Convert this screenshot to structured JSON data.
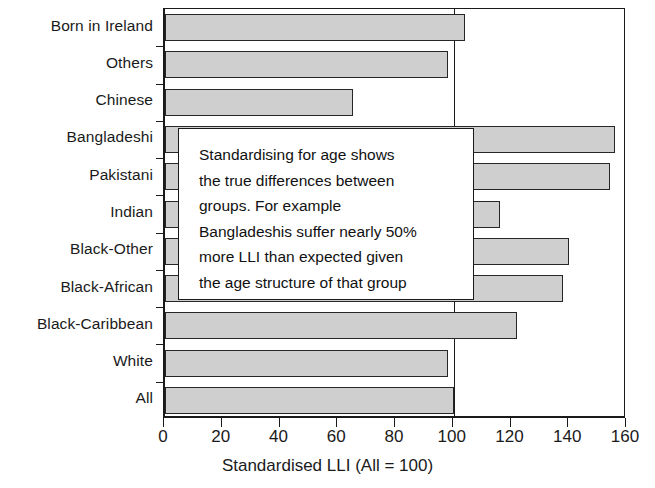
{
  "chart_data": {
    "type": "bar",
    "orientation": "horizontal",
    "title": "",
    "xlabel": "Standardised LLI (All = 100)",
    "ylabel": "",
    "xlim": [
      0,
      160
    ],
    "xticks": [
      0,
      20,
      40,
      60,
      80,
      100,
      120,
      140,
      160
    ],
    "xtick_labels": [
      "0",
      "20",
      "40",
      "60",
      "80",
      "100",
      "120",
      "140",
      "160"
    ],
    "grid": false,
    "legend": null,
    "reference_line": 100,
    "categories": [
      "Born in Ireland",
      "Others",
      "Chinese",
      "Bangladeshi",
      "Pakistani",
      "Indian",
      "Black-Other",
      "Black-African",
      "Black-Caribbean",
      "White",
      "All"
    ],
    "values": [
      104,
      98,
      65,
      156,
      154,
      116,
      140,
      138,
      122,
      98,
      100
    ],
    "annotations": [
      {
        "name": "standardising-callout",
        "text": "Standardising for age shows\nthe true differences between\ngroups. For example\nBangladeshis suffer nearly 50%\nmore LLI than expected given\nthe age structure of that group"
      }
    ],
    "colors": {
      "bar_fill": "#cfcfcf",
      "bar_edge": "#262626",
      "axis": "#1a1a1a",
      "background": "#ffffff"
    }
  }
}
